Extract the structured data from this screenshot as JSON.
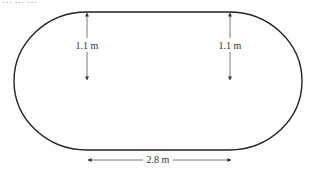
{
  "diagram": {
    "type": "running track (stadium shape) dimension diagram",
    "header_fragment": "… … …",
    "shape": {
      "name": "stadium",
      "description": "rectangle with semicircular ends",
      "stroke_color": "#222222"
    },
    "dimensions": [
      {
        "id": "left-radius",
        "label": "1.1 m",
        "orientation": "vertical"
      },
      {
        "id": "right-radius",
        "label": "1.1 m",
        "orientation": "vertical"
      },
      {
        "id": "straight-length",
        "label": "2.8 m",
        "orientation": "horizontal"
      }
    ]
  }
}
